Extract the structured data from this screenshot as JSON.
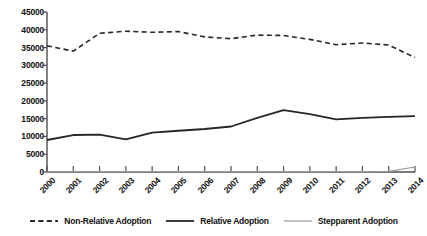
{
  "chart_data": {
    "type": "line",
    "title": "",
    "subtitle": "",
    "xlabel": "",
    "ylabel": "",
    "grid": false,
    "legend_position": "bottom",
    "categories": [
      "2000",
      "2001",
      "2002",
      "2003",
      "2004",
      "2005",
      "2006",
      "2007",
      "2008",
      "2009",
      "2010",
      "2011",
      "2012",
      "2013",
      "2014"
    ],
    "x": [
      2000,
      2001,
      2002,
      2003,
      2004,
      2005,
      2006,
      2007,
      2008,
      2009,
      2010,
      2011,
      2012,
      2013,
      2014
    ],
    "ylim": [
      0,
      45000
    ],
    "yticks": [
      0,
      5000,
      10000,
      15000,
      20000,
      25000,
      30000,
      35000,
      40000,
      45000
    ],
    "ytick_labels": [
      "0",
      "5000",
      "10000",
      "15000",
      "20000",
      "25000",
      "30000",
      "35000",
      "40000",
      "45000"
    ],
    "series": [
      {
        "name": "Non-Relative Adoption",
        "style": "dashed",
        "color": "#262626",
        "width": 1.6,
        "values": [
          35500,
          34000,
          39000,
          39600,
          39300,
          39500,
          38000,
          37500,
          38500,
          38400,
          37300,
          35800,
          36300,
          35700,
          32200
        ]
      },
      {
        "name": "Relative Adoption",
        "style": "solid",
        "color": "#262626",
        "width": 1.8,
        "values": [
          9000,
          10400,
          10500,
          9200,
          11100,
          11600,
          12100,
          12800,
          15200,
          17400,
          16300,
          14800,
          15200,
          15500,
          15700
        ]
      },
      {
        "name": "Stepparent Adoption",
        "style": "solid",
        "color": "#9a9a9a",
        "width": 1.2,
        "values": [
          100,
          100,
          100,
          100,
          100,
          100,
          100,
          100,
          100,
          100,
          100,
          100,
          100,
          200,
          1400
        ]
      }
    ]
  },
  "legend": {
    "items": [
      {
        "label": "Non-Relative Adoption",
        "swatch": "dashed-line-swatch"
      },
      {
        "label": "Relative Adoption",
        "swatch": "solid-bold-line-swatch"
      },
      {
        "label": "Stepparent Adoption",
        "swatch": "solid-thin-gray-line-swatch"
      }
    ]
  },
  "axes": {
    "axis_color": "#4d4d4d",
    "tick_color": "#4d4d4d"
  }
}
